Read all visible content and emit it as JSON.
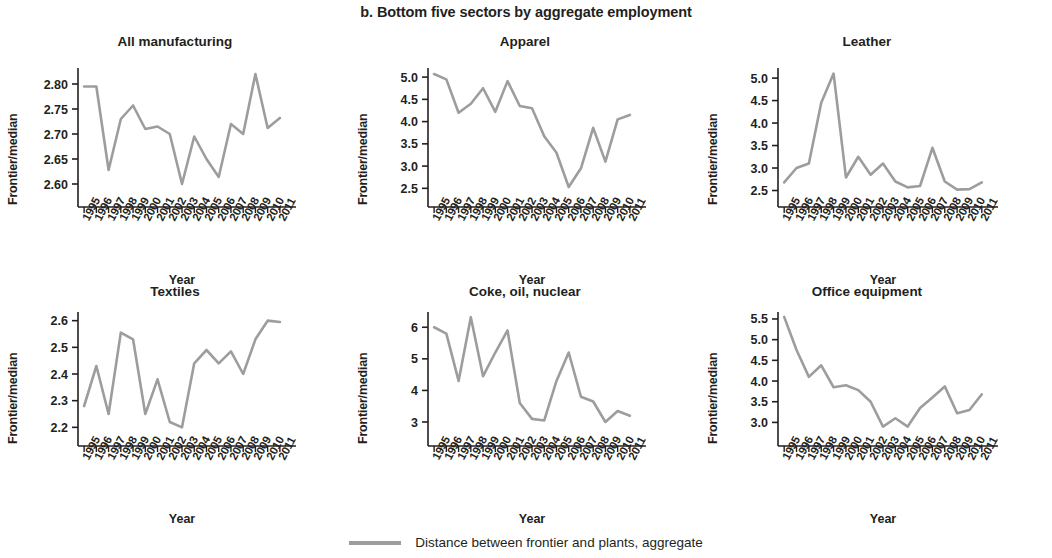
{
  "figure": {
    "title": "b. Bottom five sectors by aggregate employment",
    "line_color": "#9d9d9d",
    "axis_color": "#231f20"
  },
  "legend": {
    "marker": "line-marker",
    "label": "Distance between frontier and plants, aggregate"
  },
  "axis_titles": {
    "x": "Year",
    "y": "Frontier/median"
  },
  "chart_data": [
    {
      "type": "line",
      "title": "All manufacturing",
      "xlabel": "Year",
      "ylabel": "Frontier/median",
      "legend": "Distance between frontier and plants, aggregate",
      "grid": false,
      "x": [
        "1995",
        "1996",
        "1997",
        "1998",
        "1999",
        "2000",
        "2001",
        "2002",
        "2003",
        "2004",
        "2005",
        "2006",
        "2007",
        "2008",
        "2009",
        "2010",
        "2011"
      ],
      "values": [
        2.795,
        2.795,
        2.628,
        2.73,
        2.757,
        2.71,
        2.715,
        2.7,
        2.6,
        2.695,
        2.65,
        2.614,
        2.72,
        2.7,
        2.82,
        2.712,
        2.732
      ],
      "yticks": [
        "2.60",
        "2.65",
        "2.70",
        "2.75",
        "2.80"
      ],
      "ytickvals": [
        2.6,
        2.65,
        2.7,
        2.75,
        2.8
      ],
      "ylim": [
        2.578,
        2.828
      ]
    },
    {
      "type": "line",
      "title": "Apparel",
      "xlabel": "Year",
      "ylabel": "Frontier/median",
      "legend": "Distance between frontier and plants, aggregate",
      "grid": false,
      "x": [
        "1995",
        "1996",
        "1997",
        "1998",
        "1999",
        "2000",
        "2001",
        "2002",
        "2003",
        "2004",
        "2005",
        "2006",
        "2007",
        "2008",
        "2009",
        "2010",
        "2011"
      ],
      "values": [
        5.07,
        4.95,
        4.2,
        4.4,
        4.75,
        4.22,
        4.91,
        4.35,
        4.3,
        3.67,
        3.3,
        2.53,
        2.95,
        3.86,
        3.1,
        4.05,
        4.15
      ],
      "yticks": [
        "2.5",
        "3.0",
        "3.5",
        "4.0",
        "4.5",
        "5.0"
      ],
      "ytickvals": [
        2.5,
        3.0,
        3.5,
        4.0,
        4.5,
        5.0
      ],
      "ylim": [
        2.35,
        5.16
      ]
    },
    {
      "type": "line",
      "title": "Leather",
      "xlabel": "Year",
      "ylabel": "Frontier/median",
      "legend": "Distance between frontier and plants, aggregate",
      "grid": false,
      "x": [
        "1995",
        "1996",
        "1997",
        "1998",
        "1999",
        "2000",
        "2001",
        "2002",
        "2003",
        "2004",
        "2005",
        "2006",
        "2007",
        "2008",
        "2009",
        "2010",
        "2011"
      ],
      "values": [
        2.68,
        3.0,
        3.1,
        4.45,
        5.1,
        2.79,
        3.25,
        2.85,
        3.1,
        2.7,
        2.57,
        2.6,
        3.45,
        2.7,
        2.52,
        2.53,
        2.68
      ],
      "yticks": [
        "2.5",
        "3.0",
        "3.5",
        "4.0",
        "4.5",
        "5.0"
      ],
      "ytickvals": [
        2.5,
        3.0,
        3.5,
        4.0,
        4.5,
        5.0
      ],
      "ylim": [
        2.4,
        5.18
      ]
    },
    {
      "type": "line",
      "title": "Textiles",
      "xlabel": "Year",
      "ylabel": "Frontier/median",
      "legend": "Distance between frontier and plants, aggregate",
      "grid": false,
      "x": [
        "1995",
        "1996",
        "1997",
        "1998",
        "1999",
        "2000",
        "2001",
        "2002",
        "2003",
        "2004",
        "2005",
        "2006",
        "2007",
        "2008",
        "2009",
        "2010",
        "2011"
      ],
      "values": [
        2.28,
        2.43,
        2.25,
        2.555,
        2.53,
        2.25,
        2.38,
        2.22,
        2.2,
        2.44,
        2.49,
        2.44,
        2.485,
        2.4,
        2.53,
        2.6,
        2.595
      ],
      "yticks": [
        "2.2",
        "2.3",
        "2.4",
        "2.5",
        "2.6"
      ],
      "ytickvals": [
        2.2,
        2.3,
        2.4,
        2.5,
        2.6
      ],
      "ylim": [
        2.175,
        2.625
      ]
    },
    {
      "type": "line",
      "title": "Coke, oil, nuclear",
      "xlabel": "Year",
      "ylabel": "Frontier/median",
      "legend": "Distance between frontier and plants, aggregate",
      "grid": false,
      "x": [
        "1995",
        "1996",
        "1997",
        "1998",
        "1999",
        "2000",
        "2001",
        "2002",
        "2003",
        "2004",
        "2005",
        "2006",
        "2007",
        "2008",
        "2009",
        "2010",
        "2011"
      ],
      "values": [
        6.0,
        5.8,
        4.3,
        6.32,
        4.45,
        5.2,
        5.9,
        3.6,
        3.1,
        3.05,
        4.3,
        5.2,
        3.8,
        3.65,
        3.0,
        3.35,
        3.2
      ],
      "yticks": [
        "3",
        "4",
        "5",
        "6"
      ],
      "ytickvals": [
        3,
        4,
        5,
        6
      ],
      "ylim": [
        2.62,
        6.42
      ]
    },
    {
      "type": "line",
      "title": "Office equipment",
      "xlabel": "Year",
      "ylabel": "Frontier/median",
      "legend": "Distance between frontier and plants, aggregate",
      "grid": false,
      "x": [
        "1995",
        "1996",
        "1997",
        "1998",
        "1999",
        "2000",
        "2001",
        "2002",
        "2003",
        "2004",
        "2005",
        "2006",
        "2007",
        "2008",
        "2009",
        "2010",
        "2011"
      ],
      "values": [
        5.55,
        4.75,
        4.1,
        4.38,
        3.85,
        3.9,
        3.78,
        3.5,
        2.9,
        3.1,
        2.9,
        3.35,
        3.6,
        3.87,
        3.22,
        3.3,
        3.68
      ],
      "yticks": [
        "3.0",
        "3.5",
        "4.0",
        "4.5",
        "5.0",
        "5.5"
      ],
      "ytickvals": [
        3.0,
        3.5,
        4.0,
        4.5,
        5.0,
        5.5
      ],
      "ylim": [
        2.72,
        5.62
      ]
    }
  ]
}
